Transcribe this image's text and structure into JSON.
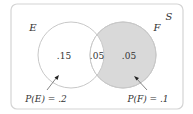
{
  "diagram": {
    "type": "venn",
    "universe_label": "S",
    "sets": [
      {
        "label": "E",
        "probability_label": "P(E) = .2",
        "only_value": ".15",
        "shaded": false
      },
      {
        "label": "F",
        "probability_label": "P(F) = .1",
        "only_value": ".05",
        "shaded": true
      }
    ],
    "intersection_value": ".05",
    "colors": {
      "frame": "#d4d4d4",
      "circle_stroke": "#c8c8c8",
      "shaded_fill": "#d9d9d9",
      "text": "#333333"
    }
  }
}
